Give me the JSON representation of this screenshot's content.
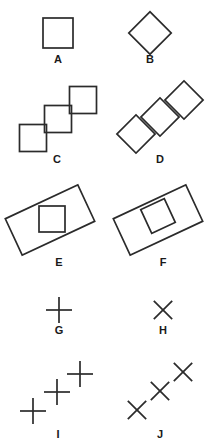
{
  "figure": {
    "background_color": "#ffffff",
    "stroke_color": "#2b2b2b",
    "label_color": "#1a1a1a",
    "width": 217,
    "height": 445,
    "panels": [
      {
        "id": "A",
        "label": "A",
        "description": "single upright square",
        "label_x": 58,
        "label_y": 63,
        "shapes": [
          {
            "kind": "square",
            "cx": 58,
            "cy": 33,
            "size": 30,
            "rotation": 0
          }
        ]
      },
      {
        "id": "B",
        "label": "B",
        "description": "single diamond (square rotated 45 degrees)",
        "label_x": 150,
        "label_y": 63,
        "shapes": [
          {
            "kind": "square",
            "cx": 150,
            "cy": 33,
            "size": 30,
            "rotation": 45
          }
        ]
      },
      {
        "id": "C",
        "label": "C",
        "description": "three upright squares in an ascending diagonal chain, corner to corner",
        "label_x": 57,
        "label_y": 163,
        "shapes": [
          {
            "kind": "square",
            "cx": 33,
            "cy": 138,
            "size": 27,
            "rotation": 0
          },
          {
            "kind": "square",
            "cx": 58,
            "cy": 119,
            "size": 27,
            "rotation": 0
          },
          {
            "kind": "square",
            "cx": 83,
            "cy": 100,
            "size": 27,
            "rotation": 0
          }
        ]
      },
      {
        "id": "D",
        "label": "D",
        "description": "three diamonds in an ascending diagonal chain, vertex to vertex",
        "label_x": 160,
        "label_y": 163,
        "shapes": [
          {
            "kind": "square",
            "cx": 136,
            "cy": 134,
            "size": 27,
            "rotation": 45
          },
          {
            "kind": "square",
            "cx": 160,
            "cy": 117,
            "size": 27,
            "rotation": 45
          },
          {
            "kind": "square",
            "cx": 184,
            "cy": 100,
            "size": 27,
            "rotation": 45
          }
        ]
      },
      {
        "id": "E",
        "label": "E",
        "description": "tilted rectangle containing an upright square",
        "label_x": 59,
        "label_y": 266,
        "shapes": [
          {
            "kind": "rect",
            "cx": 50,
            "cy": 220,
            "width": 80,
            "height": 40,
            "rotation": -25
          },
          {
            "kind": "square",
            "cx": 52,
            "cy": 219,
            "size": 26,
            "rotation": 0
          }
        ]
      },
      {
        "id": "F",
        "label": "F",
        "description": "tilted rectangle containing a square rotated to match the rectangle",
        "label_x": 163,
        "label_y": 266,
        "shapes": [
          {
            "kind": "rect",
            "cx": 158,
            "cy": 220,
            "width": 80,
            "height": 40,
            "rotation": -25
          },
          {
            "kind": "square",
            "cx": 158,
            "cy": 216,
            "size": 26,
            "rotation": -25
          }
        ]
      },
      {
        "id": "G",
        "label": "G",
        "description": "single upright plus sign",
        "label_x": 59,
        "label_y": 334,
        "shapes": [
          {
            "kind": "cross",
            "cx": 59,
            "cy": 310,
            "size": 26,
            "rotation": 0
          }
        ]
      },
      {
        "id": "H",
        "label": "H",
        "description": "single diagonal cross (X)",
        "label_x": 163,
        "label_y": 334,
        "shapes": [
          {
            "kind": "cross",
            "cx": 163,
            "cy": 310,
            "size": 26,
            "rotation": 45
          }
        ]
      },
      {
        "id": "I",
        "label": "I",
        "description": "three upright plus signs in an ascending diagonal chain",
        "label_x": 58,
        "label_y": 438,
        "shapes": [
          {
            "kind": "cross",
            "cx": 33,
            "cy": 411,
            "size": 26,
            "rotation": 0
          },
          {
            "kind": "cross",
            "cx": 57,
            "cy": 392,
            "size": 26,
            "rotation": 0
          },
          {
            "kind": "cross",
            "cx": 80,
            "cy": 374,
            "size": 26,
            "rotation": 0
          }
        ]
      },
      {
        "id": "J",
        "label": "J",
        "description": "three diagonal crosses in an ascending diagonal chain",
        "label_x": 160,
        "label_y": 438,
        "shapes": [
          {
            "kind": "cross",
            "cx": 137,
            "cy": 410,
            "size": 26,
            "rotation": 45
          },
          {
            "kind": "cross",
            "cx": 160,
            "cy": 391,
            "size": 26,
            "rotation": 45
          },
          {
            "kind": "cross",
            "cx": 183,
            "cy": 372,
            "size": 26,
            "rotation": 45
          }
        ]
      }
    ]
  }
}
